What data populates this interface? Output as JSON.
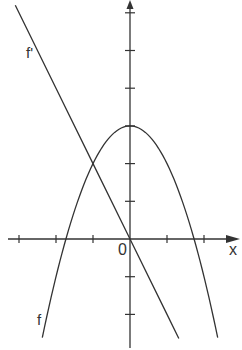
{
  "chart_data": {
    "type": "line",
    "title": "",
    "xlabel": "x",
    "ylabel": "y",
    "origin_label": "0",
    "xlim": [
      -3.0,
      2.9
    ],
    "ylim": [
      -2.95,
      6.35
    ],
    "grid": false,
    "x_ticks": [
      -3,
      -2,
      -1,
      1,
      2
    ],
    "y_ticks": [
      -2,
      -1,
      1,
      2,
      3,
      4,
      5,
      6
    ],
    "series": [
      {
        "name": "f",
        "label": "f",
        "formula": "f(x) = 3 - x^2",
        "vertex": [
          0,
          3
        ],
        "roots": [
          -1.73,
          1.73
        ],
        "x": [
          -2.37,
          -2.0,
          -1.73,
          -1.5,
          -1.0,
          -0.5,
          0.0,
          0.5,
          1.0,
          1.5,
          1.73,
          2.0,
          2.37
        ],
        "values": [
          -2.62,
          -1.0,
          0.0,
          0.75,
          2.0,
          2.75,
          3.0,
          2.75,
          2.0,
          0.75,
          0.0,
          -1.0,
          -2.62
        ]
      },
      {
        "name": "f'",
        "label": "f'",
        "formula": "f'(x) = -2x",
        "x": [
          -3.1,
          -2.0,
          -1.0,
          0.0,
          1.0,
          1.32
        ],
        "values": [
          6.2,
          4.0,
          2.0,
          0.0,
          -2.0,
          -2.64
        ]
      }
    ],
    "annotations": [
      {
        "text": "f'",
        "near": "upper-left on the line f'"
      },
      {
        "text": "f",
        "near": "lower-left on the parabola f"
      }
    ]
  },
  "labels": {
    "x_axis": "x",
    "origin": "0",
    "f_prime": "f'",
    "f": "f"
  },
  "colors": {
    "line": "#333333",
    "background": "#ffffff"
  }
}
